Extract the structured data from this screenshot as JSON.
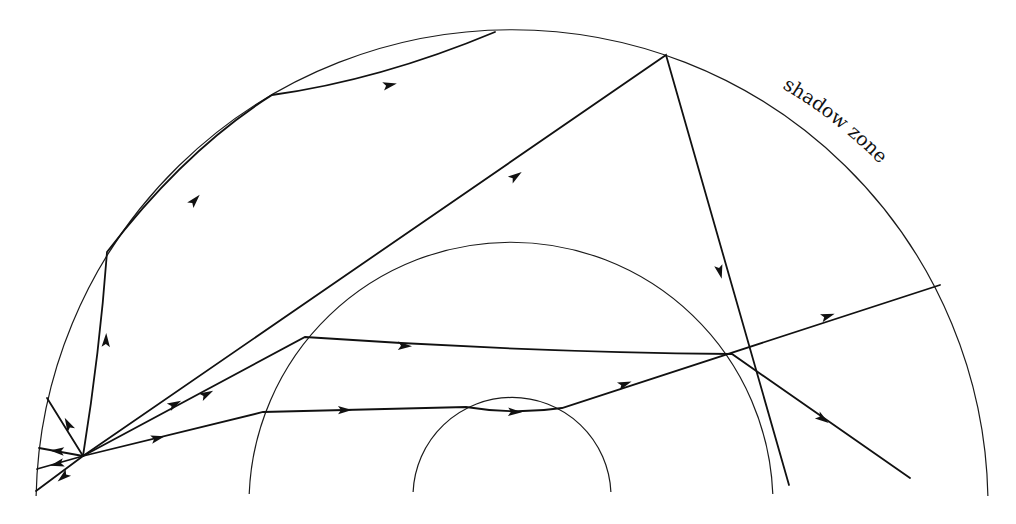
{
  "figure": {
    "labels": [
      {
        "id": "shadow-zone",
        "text": "shadow zone"
      }
    ]
  },
  "boundaries": [
    {
      "id": "surface",
      "name": "Earth surface (outer circle)",
      "cx": 512,
      "cy": 507,
      "r": 476
    },
    {
      "id": "outer-core",
      "name": "core-mantle boundary (middle circle)",
      "cx": 511,
      "cy": 503,
      "r": 262
    },
    {
      "id": "inner-core",
      "name": "inner core boundary (inner circle)",
      "cx": 512,
      "cy": 497,
      "r": 99
    }
  ],
  "source": {
    "name": "earthquake focus",
    "x": 83,
    "y": 456
  },
  "rays": [
    {
      "id": "reflected-multiple",
      "description": "ray reflecting twice off the surface",
      "path": "M83,456 Q100,350 107,252 Q185,150 272,95 Q380,80 495,32"
    },
    {
      "id": "direct-long",
      "description": "direct ray to far surface reflection, then down through core",
      "path": "M83,456 L666,55 L789,485"
    },
    {
      "id": "core-refracted",
      "description": "ray refracted through outer core exiting toward lower right",
      "path": "M83,456 L305,337 Q520,352 732,354 L910,478"
    },
    {
      "id": "inner-core",
      "description": "ray passing through inner core, emerging to surface",
      "path": "M83,456 L263,412 L466,407 Q515,415 562,408 L940,285"
    },
    {
      "id": "short-up",
      "description": "short ray to upper-left surface",
      "path": "M83,456 L47,398"
    },
    {
      "id": "short-1",
      "description": "short ray to left surface",
      "path": "M83,456 L39,448"
    },
    {
      "id": "short-2",
      "description": "short ray to left surface",
      "path": "M83,456 L37,469"
    },
    {
      "id": "short-3",
      "description": "short ray to left surface",
      "path": "M83,456 L36,491"
    }
  ],
  "arrows": [
    {
      "x": 106,
      "y": 340,
      "angle": -88
    },
    {
      "x": 195,
      "y": 200,
      "angle": -48
    },
    {
      "x": 390,
      "y": 85,
      "angle": -12
    },
    {
      "x": 516,
      "y": 176,
      "angle": -35
    },
    {
      "x": 720,
      "y": 272,
      "angle": 76
    },
    {
      "x": 175,
      "y": 404,
      "angle": -28
    },
    {
      "x": 207,
      "y": 394,
      "angle": -28
    },
    {
      "x": 405,
      "y": 346,
      "angle": 2
    },
    {
      "x": 823,
      "y": 419,
      "angle": 35
    },
    {
      "x": 158,
      "y": 438,
      "angle": -14
    },
    {
      "x": 345,
      "y": 410,
      "angle": -1
    },
    {
      "x": 515,
      "y": 412,
      "angle": 2
    },
    {
      "x": 625,
      "y": 384,
      "angle": -20
    },
    {
      "x": 828,
      "y": 316,
      "angle": -18
    },
    {
      "x": 68,
      "y": 424,
      "angle": -118
    },
    {
      "x": 57,
      "y": 451,
      "angle": 184
    },
    {
      "x": 57,
      "y": 464,
      "angle": 166
    },
    {
      "x": 63,
      "y": 477,
      "angle": 140
    }
  ]
}
